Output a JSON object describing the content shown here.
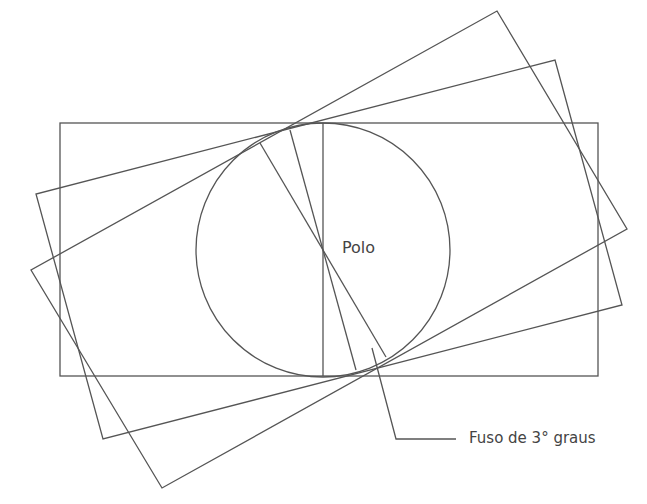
{
  "diagram": {
    "labels": {
      "pole": "Polo",
      "zone": "Fuso de 3° graus"
    },
    "colors": {
      "line": "#555555",
      "text": "#444444",
      "background": "#ffffff"
    },
    "shapes": {
      "circle": {
        "cx": 323,
        "cy": 250,
        "r": 128
      },
      "axis_rectangle": {
        "x": 60,
        "y": 123,
        "width": 538,
        "height": 253
      },
      "rotated_rectangle_a": [
        [
          497,
          11
        ],
        [
          627,
          229
        ],
        [
          162,
          488
        ],
        [
          31,
          270
        ]
      ],
      "rotated_rectangle_b": [
        [
          555,
          60
        ],
        [
          622,
          305
        ],
        [
          103,
          439
        ],
        [
          36,
          194
        ]
      ],
      "meridian_lines": [
        [
          [
            323,
            123
          ],
          [
            323,
            376
          ]
        ],
        [
          [
            260,
            143
          ],
          [
            386,
            357
          ]
        ],
        [
          [
            290,
            130
          ],
          [
            356,
            370
          ]
        ]
      ],
      "leader_line": [
        [
          372,
          348
        ],
        [
          396,
          439
        ],
        [
          456,
          439
        ]
      ]
    }
  }
}
